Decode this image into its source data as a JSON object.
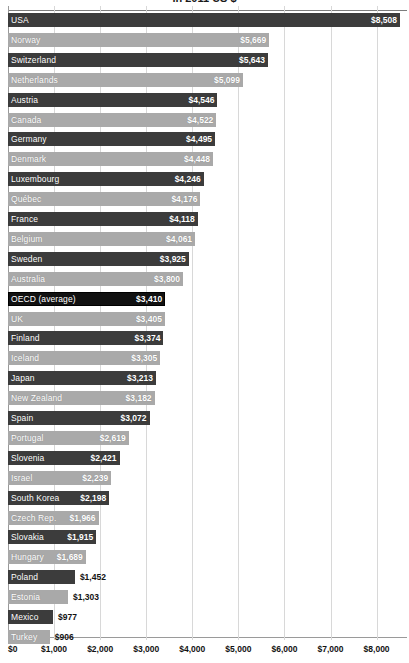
{
  "chart_data": {
    "type": "bar",
    "orientation": "horizontal",
    "title": "in 2011 US $",
    "xlabel": "",
    "ylabel": "",
    "xlim": [
      0,
      8508
    ],
    "grid": true,
    "legend": "none",
    "value_prefix": "$",
    "axis_ticks": [
      "$0",
      "$1,000",
      "$2,000",
      "$3,000",
      "$4,000",
      "$5,000",
      "$6,000",
      "$7,000",
      "$8,000"
    ],
    "axis_tick_values": [
      0,
      1000,
      2000,
      3000,
      4000,
      5000,
      6000,
      7000,
      8000
    ],
    "categories": [
      "USA",
      "Norway",
      "Switzerland",
      "Netherlands",
      "Austria",
      "Canada",
      "Germany",
      "Denmark",
      "Luxembourg",
      "Québec",
      "France",
      "Belgium",
      "Sweden",
      "Australia",
      "OECD (average)",
      "UK",
      "Finland",
      "Iceland",
      "Japan",
      "New Zealand",
      "Spain",
      "Portugal",
      "Slovenia",
      "Israel",
      "South Korea",
      "Czech Rep.",
      "Slovakia",
      "Hungary",
      "Poland",
      "Estonia",
      "Mexico",
      "Turkey"
    ],
    "values": [
      8508,
      5669,
      5643,
      5099,
      4546,
      4522,
      4495,
      4448,
      4246,
      4176,
      4118,
      4061,
      3925,
      3800,
      3410,
      3405,
      3374,
      3305,
      3213,
      3182,
      3072,
      2619,
      2421,
      2239,
      2198,
      1966,
      1915,
      1689,
      1452,
      1303,
      977,
      906
    ],
    "value_labels": [
      "$8,508",
      "$5,669",
      "$5,643",
      "$5,099",
      "$4,546",
      "$4,522",
      "$4,495",
      "$4,448",
      "$4,246",
      "$4,176",
      "$4,118",
      "$4,061",
      "$3,925",
      "$3,800",
      "$3,410",
      "$3,405",
      "$3,374",
      "$3,305",
      "$3,213",
      "$3,182",
      "$3,072",
      "$2,619",
      "$2,421",
      "$2,239",
      "$2,198",
      "$1,966",
      "$1,915",
      "$1,689",
      "$1,452",
      "$1,303",
      "$977",
      "$906"
    ],
    "highlight_category": "OECD (average)",
    "colors": {
      "bar_dark": "#3c3c3c",
      "bar_light": "#a9a9a9",
      "bar_highlight": "#111111",
      "gridline": "#d8d8d8",
      "label_inside": "#ffffff",
      "label_outside": "#111111",
      "background": "#ffffff"
    }
  }
}
